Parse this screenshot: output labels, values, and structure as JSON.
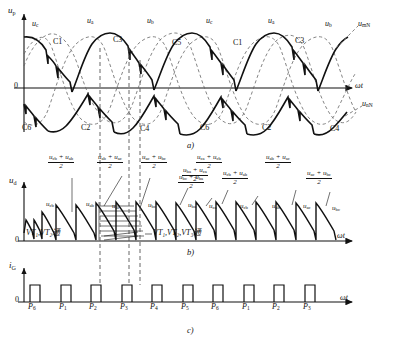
{
  "figure": {
    "title_parts": [
      "a)",
      "b)",
      "c)"
    ],
    "axis": {
      "omega_t": "ωt",
      "zero": "0"
    },
    "panel_a": {
      "y_axis_label": "u",
      "y_axis_sub": "p",
      "wave_labels_top": [
        {
          "base": "u",
          "sub": "c"
        },
        {
          "base": "u",
          "sub": "a"
        },
        {
          "base": "u",
          "sub": "b"
        },
        {
          "base": "u",
          "sub": "c"
        },
        {
          "base": "u",
          "sub": "a"
        },
        {
          "base": "u",
          "sub": "b"
        }
      ],
      "crossing_labels_top": [
        "C1",
        "C3",
        "C5",
        "C1",
        "C3"
      ],
      "crossing_labels_bottom": [
        "C6",
        "C2",
        "C4",
        "C6",
        "C2",
        "C4"
      ],
      "right_labels": [
        {
          "base": "u",
          "sub": "mN"
        },
        {
          "base": "u",
          "sub": "nN"
        }
      ]
    },
    "panel_b": {
      "y_axis_label": "u",
      "y_axis_sub": "d",
      "fractions": [
        {
          "num": "uₑᵇ + uₐᵇ",
          "den": "2",
          "n1": "u",
          "s1": "cb",
          "n2": "u",
          "s2": "ab"
        },
        {
          "n1": "u",
          "s1": "ab",
          "n2": "u",
          "s2": "ac",
          "den": "2"
        },
        {
          "n1": "u",
          "s1": "ac",
          "n2": "u",
          "s2": "bc",
          "den": "2"
        },
        {
          "n1": "u",
          "s1": "bc",
          "n2": "u",
          "s2": "ba",
          "den": "2"
        },
        {
          "n1": "u",
          "s1": "ba",
          "n2": "u",
          "s2": "ca",
          "den": "2"
        },
        {
          "n1": "u",
          "s1": "ca",
          "n2": "u",
          "s2": "cb",
          "den": "2"
        },
        {
          "n1": "u",
          "s1": "cb",
          "n2": "u",
          "s2": "ab",
          "den": "2"
        },
        {
          "n1": "u",
          "s1": "ab",
          "n2": "u",
          "s2": "ac",
          "den": "2"
        },
        {
          "n1": "u",
          "s1": "ac",
          "n2": "u",
          "s2": "bc",
          "den": "2"
        }
      ],
      "segment_labels": [
        {
          "base": "u",
          "sub": "cb"
        },
        {
          "base": "u",
          "sub": "ab"
        },
        {
          "base": "u",
          "sub": "ac"
        },
        {
          "base": "u",
          "sub": "bc"
        },
        {
          "base": "u",
          "sub": "ba"
        },
        {
          "base": "u",
          "sub": "ca"
        },
        {
          "base": "u",
          "sub": "cb"
        },
        {
          "base": "u",
          "sub": "ab"
        },
        {
          "base": "u",
          "sub": "ac"
        },
        {
          "base": "u",
          "sub": "bc"
        }
      ],
      "conduction_left": "VT₁,VT₂通",
      "conduction_right": "VT₁,VT₂,VT₃通"
    },
    "panel_c": {
      "y_axis_label": "i",
      "y_axis_sub": "G",
      "pulse_labels": [
        {
          "base": "P",
          "sub": "6"
        },
        {
          "base": "P",
          "sub": "1"
        },
        {
          "base": "P",
          "sub": "2"
        },
        {
          "base": "P",
          "sub": "3"
        },
        {
          "base": "P",
          "sub": "4"
        },
        {
          "base": "P",
          "sub": "5"
        },
        {
          "base": "P",
          "sub": "6"
        },
        {
          "base": "P",
          "sub": "1"
        },
        {
          "base": "P",
          "sub": "2"
        },
        {
          "base": "P",
          "sub": "3"
        }
      ]
    },
    "colors": {
      "ink": "#111111",
      "dash": "#555555",
      "background": "#ffffff"
    }
  }
}
